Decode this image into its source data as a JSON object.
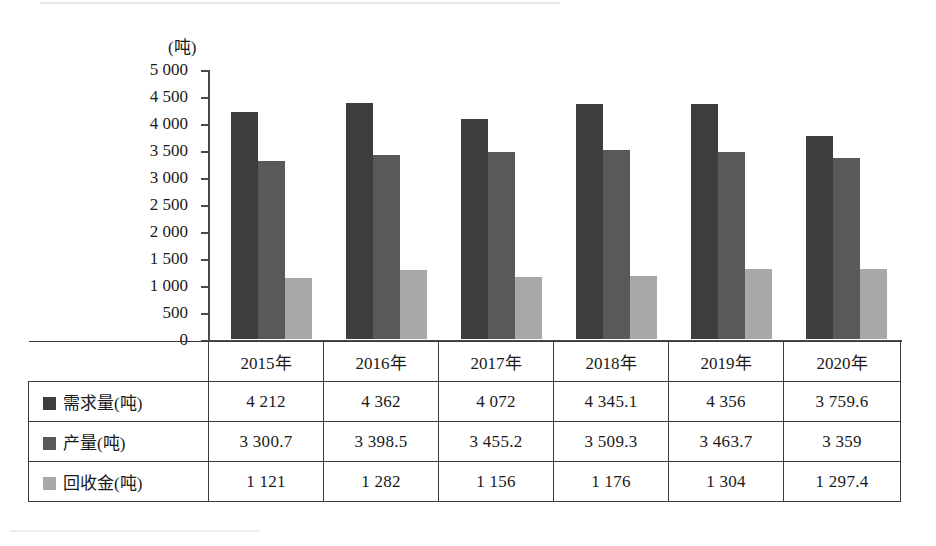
{
  "chart_data": {
    "type": "bar",
    "title": "",
    "xlabel": "",
    "ylabel": "(吨)",
    "ylim": [
      0,
      5000
    ],
    "grid": false,
    "legend_position": "table-row-labels",
    "categories": [
      "2015年",
      "2016年",
      "2017年",
      "2018年",
      "2019年",
      "2020年"
    ],
    "ytick_labels": [
      "5 000",
      "4 500",
      "4 000",
      "3 500",
      "3 000",
      "2 500",
      "2 000",
      "1 500",
      "1 000",
      "500",
      "0"
    ],
    "ytick_values": [
      5000,
      4500,
      4000,
      3500,
      3000,
      2500,
      2000,
      1500,
      1000,
      500,
      0
    ],
    "series": [
      {
        "name": "需求量(吨)",
        "color": "#3d3d3d",
        "values": [
          4212,
          4362,
          4072,
          4345.1,
          4356,
          3759.6
        ],
        "labels": [
          "4 212",
          "4 362",
          "4 072",
          "4 345.1",
          "4 356",
          "3 759.6"
        ]
      },
      {
        "name": "产量(吨)",
        "color": "#595959",
        "values": [
          3300.7,
          3398.5,
          3455.2,
          3509.3,
          3463.7,
          3359
        ],
        "labels": [
          "3 300.7",
          "3 398.5",
          "3 455.2",
          "3 509.3",
          "3 463.7",
          "3 359"
        ]
      },
      {
        "name": "回收金(吨)",
        "color": "#a8a8a8",
        "values": [
          1121,
          1282,
          1156,
          1176,
          1304,
          1297.4
        ],
        "labels": [
          "1 121",
          "1 282",
          "1 156",
          "1 176",
          "1 304",
          "1 297.4"
        ]
      }
    ]
  },
  "axis": {
    "unit_caption": "(吨)"
  },
  "table": {
    "header": [
      "",
      "2015年",
      "2016年",
      "2017年",
      "2018年",
      "2019年",
      "2020年"
    ],
    "rows": [
      {
        "label": "需求量(吨)",
        "swatch": "#3d3d3d",
        "values": [
          "4 212",
          "4 362",
          "4 072",
          "4 345.1",
          "4 356",
          "3 759.6"
        ]
      },
      {
        "label": "产量(吨)",
        "swatch": "#595959",
        "values": [
          "3 300.7",
          "3 398.5",
          "3 455.2",
          "3 509.3",
          "3 463.7",
          "3 359"
        ]
      },
      {
        "label": "回收金(吨)",
        "swatch": "#a8a8a8",
        "values": [
          "1 121",
          "1 282",
          "1 156",
          "1 176",
          "1 304",
          "1 297.4"
        ]
      }
    ]
  }
}
